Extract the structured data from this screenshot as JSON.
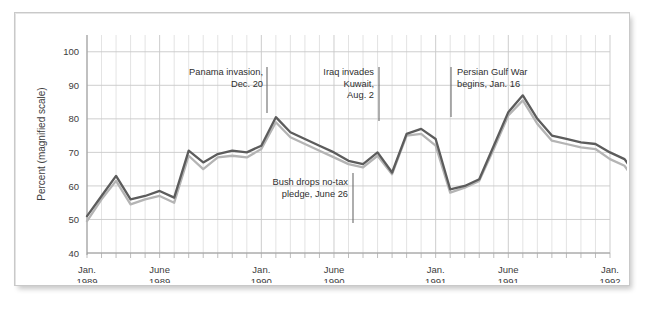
{
  "chart_data": {
    "type": "line",
    "title": "",
    "xlabel": "",
    "ylabel": "Percent (magnified scale)",
    "ylim": [
      40,
      105
    ],
    "yticks": [
      40,
      50,
      60,
      70,
      80,
      90,
      100
    ],
    "grid": true,
    "legend": "none",
    "xlim_months": [
      0,
      36
    ],
    "x_tick_labels": [
      {
        "month_index": 0,
        "line1": "Jan.",
        "line2": "1989"
      },
      {
        "month_index": 5,
        "line1": "June",
        "line2": "1989"
      },
      {
        "month_index": 12,
        "line1": "Jan.",
        "line2": "1990"
      },
      {
        "month_index": 17,
        "line1": "June",
        "line2": "1990"
      },
      {
        "month_index": 24,
        "line1": "Jan.",
        "line2": "1991"
      },
      {
        "month_index": 29,
        "line1": "June",
        "line2": "1991"
      },
      {
        "month_index": 36,
        "line1": "Jan.",
        "line2": "1992"
      }
    ],
    "series": [
      {
        "name": "dark",
        "color": "#5c5c5c",
        "values": [
          51,
          57,
          63,
          56,
          57,
          58.5,
          56.5,
          70.5,
          67,
          69.5,
          70.5,
          70,
          72,
          80.5,
          76,
          74,
          72,
          70,
          67.5,
          66.5,
          70,
          64,
          75.5,
          77,
          74,
          59,
          60,
          62,
          72,
          82,
          87,
          80,
          75,
          74,
          73,
          72.5,
          70,
          68,
          62,
          58.5,
          56,
          49
        ]
      },
      {
        "name": "light",
        "color": "#b4b4b4",
        "values": [
          49.5,
          56,
          61.5,
          54.5,
          56,
          57,
          55,
          69,
          65,
          68.5,
          69,
          68.5,
          71,
          79,
          74.5,
          72.5,
          70.5,
          68.5,
          66.5,
          65.5,
          69,
          63.5,
          75,
          75.5,
          72,
          58,
          59.5,
          61.5,
          71,
          81,
          85.5,
          78.5,
          73.5,
          72.5,
          71.5,
          71,
          68,
          66,
          60,
          56.5,
          54,
          47
        ]
      }
    ],
    "annotations": [
      {
        "id": "panama-invasion",
        "lines": [
          "Panama invasion,",
          "Dec. 20"
        ],
        "align": "right",
        "leader": "right"
      },
      {
        "id": "iraq-invades-kuwait",
        "lines": [
          "Iraq invades",
          "Kuwait,",
          "Aug. 2"
        ],
        "align": "right",
        "leader": "right"
      },
      {
        "id": "bush-drops-no-tax-pledge",
        "lines": [
          "Bush drops no-tax",
          "pledge, June 26"
        ],
        "align": "right",
        "leader": "right"
      },
      {
        "id": "persian-gulf-war-begins",
        "lines": [
          "Persian Gulf War",
          "begins, Jan. 16"
        ],
        "align": "left",
        "leader": "left"
      }
    ]
  },
  "colors": {
    "series_dark": "#5c5c5c",
    "series_light": "#b4b4b4",
    "grid_minor": "#dcdcdc",
    "grid_major": "#c9c9c9",
    "frame": "#c9c9c9",
    "text": "#3d3d3d",
    "background": "#ffffff"
  }
}
